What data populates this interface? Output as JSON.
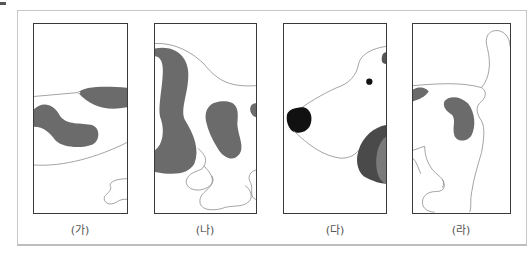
{
  "figure": {
    "panels": [
      {
        "id": "ga",
        "label": "(가)",
        "content": "dog body middle section with spots"
      },
      {
        "id": "na",
        "label": "(나)",
        "content": "dog ear, back and front legs with spot"
      },
      {
        "id": "da",
        "label": "(다)",
        "content": "dog head with nose, eye and ear"
      },
      {
        "id": "ra",
        "label": "(라)",
        "content": "dog rear with tail, spot and hind leg"
      }
    ],
    "colors": {
      "outline": "#8a8a8a",
      "spot": "#6b6b6b",
      "ear_dark": "#4a4a4a",
      "ear_light": "#7a7a7a",
      "nose": "#111111",
      "panel_border": "#3a3a3a",
      "frame_border": "#c8c8c8"
    }
  }
}
